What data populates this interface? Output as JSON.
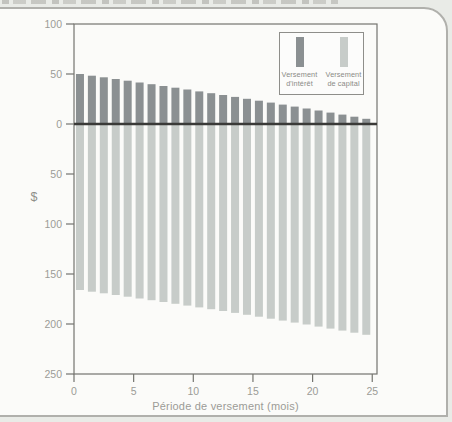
{
  "page": {
    "background_color": "#e9ebe7",
    "panel_background": "#fbfbf9",
    "panel_border_color": "#b0b0ac"
  },
  "chart_data": {
    "type": "bar",
    "orientation": "diverging-vertical",
    "title": "",
    "xlabel": "Période de versement (mois)",
    "ylabel": "$",
    "xlim": [
      0,
      25.4
    ],
    "ylim": [
      -250,
      100
    ],
    "grid": false,
    "legend_position": "top-right-inside",
    "x_tick_labels": [
      "0",
      "5",
      "10",
      "15",
      "20",
      "25"
    ],
    "x_tick_values": [
      0,
      5,
      10,
      15,
      20,
      25
    ],
    "y_tick_labels": [
      "100",
      "50",
      "0",
      "50",
      "100",
      "150",
      "200",
      "250"
    ],
    "y_tick_values": [
      100,
      50,
      0,
      -50,
      -100,
      -150,
      -200,
      -250
    ],
    "periods": [
      1,
      2,
      3,
      4,
      5,
      6,
      7,
      8,
      9,
      10,
      11,
      12,
      13,
      14,
      15,
      16,
      17,
      18,
      19,
      20,
      21,
      22,
      23,
      24,
      25
    ],
    "series": [
      {
        "name": "Versement d'intérêt",
        "label_lines": [
          "Versement",
          "d'intérêt"
        ],
        "direction": "up",
        "color": "#8b9092",
        "values": [
          50.0,
          48.3,
          46.7,
          45.0,
          43.3,
          41.5,
          39.8,
          38.0,
          36.3,
          34.5,
          32.6,
          30.8,
          29.0,
          27.1,
          25.2,
          23.3,
          21.4,
          19.4,
          17.4,
          15.5,
          13.5,
          11.4,
          9.4,
          7.3,
          5.2
        ]
      },
      {
        "name": "Versement de capital",
        "label_lines": [
          "Versement",
          "de capital"
        ],
        "direction": "down",
        "color": "#c7ccc9",
        "values": [
          166.0,
          167.7,
          169.3,
          171.0,
          172.7,
          174.5,
          176.2,
          178.0,
          179.8,
          181.6,
          183.4,
          185.2,
          187.0,
          188.9,
          190.8,
          192.7,
          194.7,
          196.6,
          198.6,
          200.5,
          202.6,
          204.6,
          206.6,
          208.7,
          210.8
        ]
      }
    ],
    "axis_color": "#74746f",
    "zero_line_color": "#3a3a38",
    "tick_text_color": "#9c9c97"
  }
}
